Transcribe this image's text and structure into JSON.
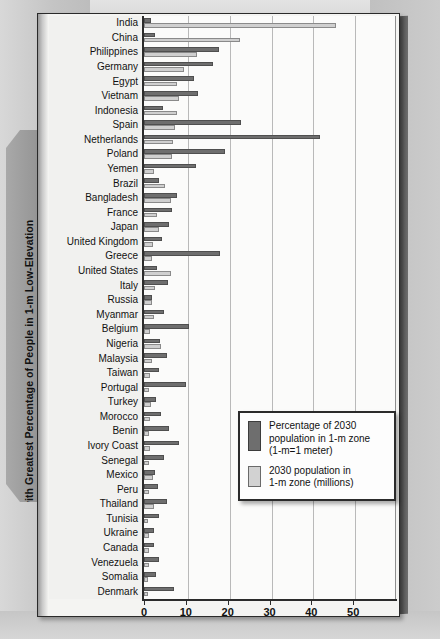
{
  "figure": {
    "vertical_title": "Countries with Greatest Percentage of People in 1-m Low-Elevation Coastal Zone, 2030"
  },
  "legend": {
    "items": [
      {
        "swatch": "dark",
        "line1": "Percentage of 2030",
        "line2": "population in 1-m zone",
        "line3": "(1-m=1 meter)"
      },
      {
        "swatch": "light",
        "line1": "2030 population in",
        "line2": "1-m zone (millions)",
        "line3": ""
      }
    ]
  },
  "chart_data": {
    "type": "bar",
    "orientation": "horizontal",
    "title": "Countries with Greatest Percentage of People in 1-m Low-Elevation Coastal Zone, 2030",
    "xlabel": "",
    "ylabel": "",
    "xlim": [
      0,
      60
    ],
    "xticks": [
      0,
      10,
      20,
      30,
      40,
      50
    ],
    "grid": true,
    "legend_position": "bottom-right",
    "categories": [
      "India",
      "China",
      "Philippines",
      "Germany",
      "Egypt",
      "Vietnam",
      "Indonesia",
      "Spain",
      "Netherlands",
      "Poland",
      "Yemen",
      "Brazil",
      "Bangladesh",
      "France",
      "Japan",
      "United Kingdom",
      "Greece",
      "United States",
      "Italy",
      "Russia",
      "Myanmar",
      "Belgium",
      "Nigeria",
      "Malaysia",
      "Taiwan",
      "Portugal",
      "Turkey",
      "Morocco",
      "Benin",
      "Ivory Coast",
      "Senegal",
      "Mexico",
      "Peru",
      "Thailand",
      "Tunisia",
      "Ukraine",
      "Canada",
      "Venezuela",
      "Somalia",
      "Denmark"
    ],
    "series": [
      {
        "name": "Percentage of 2030 population in 1-m zone (1-m=1 meter)",
        "color": "#6e6e6e",
        "values": [
          1.2,
          2.2,
          17.5,
          16.0,
          11.5,
          12.5,
          4.0,
          22.8,
          41.5,
          19.0,
          12.0,
          3.2,
          7.5,
          6.2,
          5.5,
          3.8,
          17.6,
          2.6,
          5.2,
          1.5,
          4.2,
          10.2,
          3.4,
          5.0,
          3.0,
          9.6,
          2.4,
          3.6,
          5.4,
          7.8,
          4.4,
          2.2,
          2.8,
          5.0,
          3.0,
          2.0,
          1.8,
          3.2,
          2.4,
          6.8
        ]
      },
      {
        "name": "2030 population in 1-m zone (millions)",
        "color": "#cfcfcf",
        "values": [
          45.5,
          22.5,
          12.2,
          9.0,
          7.5,
          8.0,
          7.3,
          7.0,
          6.4,
          6.2,
          2.0,
          4.5,
          6.0,
          2.6,
          3.0,
          1.6,
          1.5,
          6.0,
          2.2,
          1.4,
          1.8,
          1.0,
          3.5,
          1.5,
          1.0,
          0.8,
          1.2,
          1.0,
          0.7,
          1.0,
          0.8,
          1.6,
          0.7,
          2.0,
          0.5,
          0.7,
          0.6,
          0.8,
          0.5,
          0.5
        ]
      }
    ]
  }
}
